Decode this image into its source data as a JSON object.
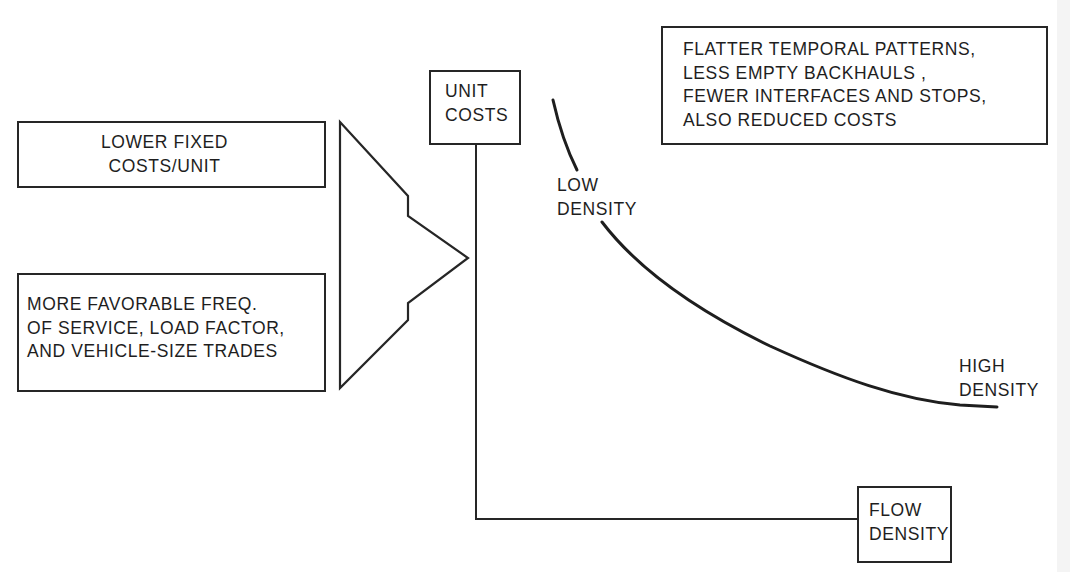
{
  "diagram": {
    "type": "cost-curve-schematic",
    "inputs": [
      {
        "id": "fixed-costs",
        "lines": [
          "LOWER FIXED",
          "COSTS/UNIT"
        ]
      },
      {
        "id": "service-trades",
        "lines": [
          "MORE FAVORABLE FREQ.",
          "OF SERVICE, LOAD FACTOR,",
          "AND VEHICLE-SIZE TRADES"
        ]
      }
    ],
    "arrow": {
      "shape": "double-notched-triangle",
      "direction": "right"
    },
    "axes": {
      "y_label": [
        "UNIT",
        "COSTS"
      ],
      "x_label": [
        "FLOW",
        "DENSITY"
      ]
    },
    "curve": {
      "description": "Unit costs decline as flow density increases",
      "start_label": [
        "LOW",
        "DENSITY"
      ],
      "end_label": [
        "HIGH",
        "DENSITY"
      ]
    },
    "note": {
      "lines": [
        "FLATTER TEMPORAL PATTERNS,",
        "LESS EMPTY BACKHAULS ,",
        "FEWER INTERFACES AND STOPS,",
        "ALSO REDUCED COSTS"
      ]
    },
    "colors": {
      "ink": "#262626",
      "background": "#ffffff"
    }
  }
}
